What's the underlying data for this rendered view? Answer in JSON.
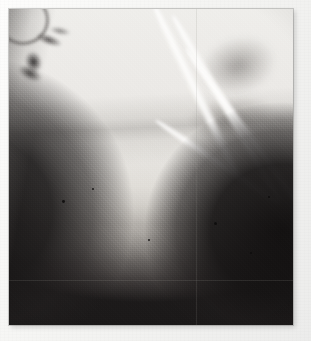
{
  "image": {
    "kind": "radiograph",
    "modality": "X-ray",
    "caption": "Grayscale radiographic film image",
    "colors": {
      "paper": "#f4f4f2",
      "film_dark": "#201d1d",
      "film_bright": "#efeeeb",
      "midtone": "#8d8a86",
      "gridline": "rgba(150,146,142,.17)"
    },
    "frame": {
      "left": 9,
      "top": 9,
      "width": 284,
      "height": 316
    },
    "regions": [
      {
        "name": "bright-soft-tissue-dome",
        "label": ""
      },
      {
        "name": "dark-lung-field",
        "label": ""
      },
      {
        "name": "rib-shadows",
        "label": ""
      },
      {
        "name": "left-tissue-wedge",
        "label": ""
      },
      {
        "name": "right-dense-mass",
        "label": ""
      }
    ],
    "gridlines": {
      "horizontal": [
        280
      ],
      "vertical": [
        196
      ]
    },
    "specks": [
      {
        "x": 62,
        "y": 200,
        "r": 1.4
      },
      {
        "x": 148,
        "y": 239,
        "r": 1.2
      },
      {
        "x": 214,
        "y": 222,
        "r": 1.5
      },
      {
        "x": 250,
        "y": 252,
        "r": 1.1
      },
      {
        "x": 92,
        "y": 188,
        "r": 1.0
      },
      {
        "x": 268,
        "y": 196,
        "r": 1.0
      }
    ]
  }
}
